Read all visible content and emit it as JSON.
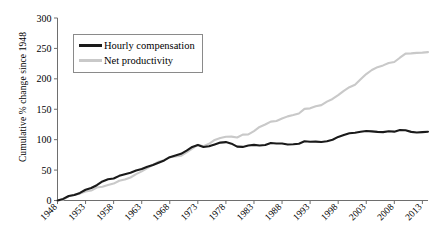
{
  "chart_data": {
    "type": "line",
    "title": "",
    "xlabel": "",
    "ylabel": "Cumulative % change since 1948",
    "xlim": [
      1948,
      2014
    ],
    "ylim": [
      0,
      300
    ],
    "grid": false,
    "legend_position": "top-left-inside",
    "y_ticks": [
      0,
      50,
      100,
      150,
      200,
      250,
      300
    ],
    "x_ticks": [
      1948,
      1953,
      1958,
      1963,
      1968,
      1973,
      1978,
      1983,
      1988,
      1993,
      1998,
      2003,
      2008,
      2013
    ],
    "x": [
      1948,
      1949,
      1950,
      1951,
      1952,
      1953,
      1954,
      1955,
      1956,
      1957,
      1958,
      1959,
      1960,
      1961,
      1962,
      1963,
      1964,
      1965,
      1966,
      1967,
      1968,
      1969,
      1970,
      1971,
      1972,
      1973,
      1974,
      1975,
      1976,
      1977,
      1978,
      1979,
      1980,
      1981,
      1982,
      1983,
      1984,
      1985,
      1986,
      1987,
      1988,
      1989,
      1990,
      1991,
      1992,
      1993,
      1994,
      1995,
      1996,
      1997,
      1998,
      1999,
      2000,
      2001,
      2002,
      2003,
      2004,
      2005,
      2006,
      2007,
      2008,
      2009,
      2010,
      2011,
      2012,
      2013,
      2014
    ],
    "series": [
      {
        "name": "Hourly compensation",
        "color": "#1a1a1a",
        "width": 2.1,
        "values": [
          0,
          2.6,
          7.4,
          9.0,
          12.4,
          17.7,
          20.6,
          25.1,
          31.3,
          34.8,
          36.1,
          40.5,
          43.2,
          45.6,
          49.3,
          51.8,
          55.4,
          58.3,
          62.2,
          65.9,
          71.3,
          74.1,
          76.7,
          82.1,
          88.1,
          91.3,
          88.0,
          89.1,
          92.2,
          95.2,
          96.0,
          93.4,
          88.6,
          88.1,
          90.3,
          91.5,
          90.5,
          91.2,
          94.5,
          93.8,
          93.6,
          92.0,
          92.5,
          93.4,
          97.3,
          96.6,
          96.8,
          96.2,
          97.3,
          99.8,
          104.5,
          107.6,
          110.6,
          111.5,
          113.0,
          114.2,
          113.6,
          112.8,
          112.4,
          113.8,
          113.2,
          115.8,
          115.4,
          112.8,
          111.7,
          112.4,
          113.1
        ]
      },
      {
        "name": "Net productivity",
        "color": "#c9c9c9",
        "width": 2.1,
        "values": [
          0,
          1.3,
          6.9,
          9.3,
          11.3,
          14.8,
          16.3,
          21.3,
          22.5,
          25.4,
          27.8,
          32.5,
          34.4,
          37.8,
          43.3,
          47.9,
          53.4,
          58.7,
          63.8,
          66.3,
          71.2,
          72.4,
          73.6,
          79.0,
          85.3,
          91.6,
          89.2,
          93.2,
          99.5,
          102.6,
          104.7,
          105.0,
          103.6,
          108.3,
          108.7,
          114.2,
          120.9,
          124.9,
          129.6,
          130.8,
          134.7,
          138.3,
          140.5,
          143.0,
          150.6,
          151.5,
          154.9,
          156.8,
          162.5,
          166.9,
          173.1,
          180.3,
          186.3,
          190.4,
          199.2,
          207.9,
          214.5,
          219.2,
          222.1,
          226.1,
          227.6,
          234.7,
          241.5,
          241.8,
          242.6,
          243.1,
          243.9
        ]
      }
    ]
  },
  "legend": {
    "items": [
      {
        "label": "Hourly compensation"
      },
      {
        "label": "Net productivity"
      }
    ]
  },
  "axes": {
    "y_title": "Cumulative % change since 1948"
  }
}
